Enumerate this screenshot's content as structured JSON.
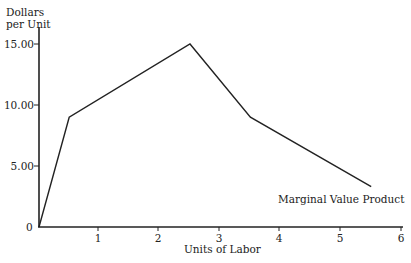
{
  "chart_data": {
    "type": "line",
    "title": "",
    "xlabel": "Units of Labor",
    "ylabel": "Dollars per Unit",
    "ylabel_lines": [
      "Dollars",
      "per Unit"
    ],
    "x_ticks": [
      "1",
      "2",
      "3",
      "4",
      "5",
      "6"
    ],
    "y_ticks": [
      "0",
      "5.00",
      "10.00",
      "15.00"
    ],
    "xlim": [
      0,
      6
    ],
    "ylim": [
      0,
      16
    ],
    "grid": false,
    "series": [
      {
        "name": "Marginal Value Product",
        "x": [
          0,
          0.5,
          2.5,
          3.5,
          5.5
        ],
        "y": [
          0,
          9,
          15,
          9,
          3.3
        ]
      }
    ],
    "annotations": [
      {
        "text": "Marginal Value Product",
        "near": "end of line"
      }
    ]
  }
}
